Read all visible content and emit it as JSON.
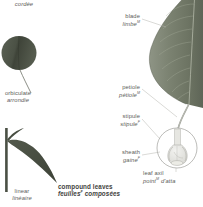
{
  "page": {
    "background": "#ffffff",
    "text_color": "#5d5d5a",
    "emphasis_color": "#3f3f3d"
  },
  "labels": {
    "cordee": {
      "fr": "cordée"
    },
    "orbiculate": {
      "en": "orbiculate",
      "fr": "arrondie"
    },
    "linear": {
      "en": "linear",
      "fr": "linéaire"
    },
    "compound": {
      "en": "compound leaves",
      "fr": "feuilles",
      "fr_sup": "F",
      "fr_rest": "composées"
    },
    "blade": {
      "en": "blade",
      "fr": "limbe",
      "sup": "M"
    },
    "petiole": {
      "en": "petiole",
      "fr": "pétiole",
      "sup": "M"
    },
    "stipule": {
      "en": "stipule",
      "fr": "stipule",
      "sup": "F"
    },
    "sheath": {
      "en": "sheath",
      "fr": "gaine",
      "sup": "F"
    },
    "leaf_axil": {
      "en": "leaf axil",
      "fr": "point",
      "sup": "M",
      "fr_rest": "d'atta"
    }
  },
  "illustrations": {
    "orbiculate_leaf": {
      "name": "orbiculate leaf silhouette",
      "fill": "#4f554a"
    },
    "linear_leaf": {
      "name": "linear leaf silhouette",
      "fill": "#4c5247"
    },
    "simple_leaf": {
      "name": "simple leaf with pinnate venation",
      "fill": "#79806f"
    },
    "magnifier": {
      "name": "leaf base detail circle",
      "stroke": "#8f8f8a"
    }
  }
}
